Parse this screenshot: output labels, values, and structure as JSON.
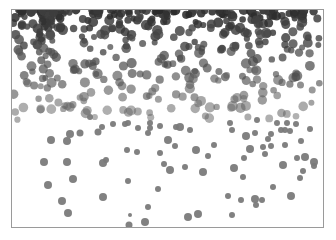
{
  "image": {
    "description": "Grayscale image of scattered round dots, dense and dark at the top, becoming sparse and lighter toward the bottom, inside a thin gray frame",
    "frame": {
      "x": 11,
      "y": 9,
      "w": 313,
      "h": 219,
      "border_color": "#9a9a9a"
    },
    "colors": {
      "background": "#ffffff",
      "dot_dark": "#3a3a3a",
      "dot_mid": "#5e5e5e",
      "dot_light": "#7a7a7a"
    },
    "sparse_dots": [
      [
        67,
        141,
        4
      ],
      [
        51,
        140,
        4
      ],
      [
        70,
        134,
        4
      ],
      [
        80,
        133,
        3.5
      ],
      [
        44,
        162,
        4
      ],
      [
        67,
        162,
        4
      ],
      [
        98,
        132,
        3.5
      ],
      [
        102,
        127,
        3
      ],
      [
        113,
        124,
        3
      ],
      [
        125,
        124,
        3
      ],
      [
        90,
        117,
        3
      ],
      [
        138,
        128,
        3
      ],
      [
        48,
        185,
        4
      ],
      [
        73,
        179,
        4
      ],
      [
        103,
        163,
        4
      ],
      [
        106,
        160,
        3
      ],
      [
        127,
        150,
        3
      ],
      [
        137,
        152,
        3
      ],
      [
        148,
        133,
        3
      ],
      [
        150,
        123,
        3
      ],
      [
        160,
        126,
        3
      ],
      [
        164,
        164,
        3
      ],
      [
        160,
        153,
        3
      ],
      [
        185,
        167,
        3
      ],
      [
        62,
        201,
        4
      ],
      [
        68,
        213,
        4
      ],
      [
        103,
        197,
        4
      ],
      [
        145,
        222,
        4
      ],
      [
        129,
        225,
        3.5
      ],
      [
        130,
        215,
        2
      ],
      [
        148,
        207,
        3
      ],
      [
        128,
        181,
        3
      ],
      [
        128,
        123,
        3
      ],
      [
        150,
        128,
        3
      ],
      [
        168,
        140,
        4
      ],
      [
        180,
        127,
        4
      ],
      [
        196,
        150,
        4
      ],
      [
        176,
        127,
        3
      ],
      [
        170,
        170,
        4
      ],
      [
        190,
        130,
        3
      ],
      [
        208,
        156,
        3
      ],
      [
        214,
        145,
        3
      ],
      [
        203,
        172,
        4
      ],
      [
        198,
        214,
        4
      ],
      [
        241,
        200,
        3
      ],
      [
        188,
        217,
        4
      ],
      [
        158,
        189,
        3
      ],
      [
        175,
        146,
        3
      ],
      [
        232,
        130,
        3
      ],
      [
        250,
        149,
        4
      ],
      [
        246,
        136,
        4
      ],
      [
        234,
        168,
        4
      ],
      [
        244,
        158,
        3
      ],
      [
        263,
        147,
        3
      ],
      [
        268,
        139,
        3
      ],
      [
        265,
        154,
        3
      ],
      [
        271,
        146,
        3
      ],
      [
        281,
        130,
        3
      ],
      [
        277,
        123,
        3
      ],
      [
        296,
        124,
        3
      ],
      [
        287,
        123,
        3
      ],
      [
        271,
        134,
        3
      ],
      [
        301,
        141,
        3
      ],
      [
        305,
        157,
        4
      ],
      [
        300,
        178,
        3
      ],
      [
        273,
        187,
        3
      ],
      [
        283,
        165,
        4
      ],
      [
        297,
        158,
        3
      ],
      [
        285,
        145,
        3
      ],
      [
        314,
        162,
        4
      ],
      [
        232,
        215,
        3
      ],
      [
        255,
        199,
        4
      ],
      [
        228,
        196,
        3
      ],
      [
        255,
        133,
        3
      ],
      [
        285,
        130,
        3
      ],
      [
        310,
        129,
        3
      ],
      [
        230,
        123,
        3
      ],
      [
        290,
        131,
        3
      ],
      [
        303,
        171,
        3
      ],
      [
        291,
        196,
        4
      ],
      [
        256,
        205,
        3
      ],
      [
        243,
        177,
        3
      ],
      [
        262,
        200,
        3
      ],
      [
        314,
        166,
        3
      ],
      [
        257,
        120,
        3
      ]
    ],
    "band_top": 10,
    "band_bottom": 120,
    "band_seed": 7,
    "band_count": 420
  }
}
